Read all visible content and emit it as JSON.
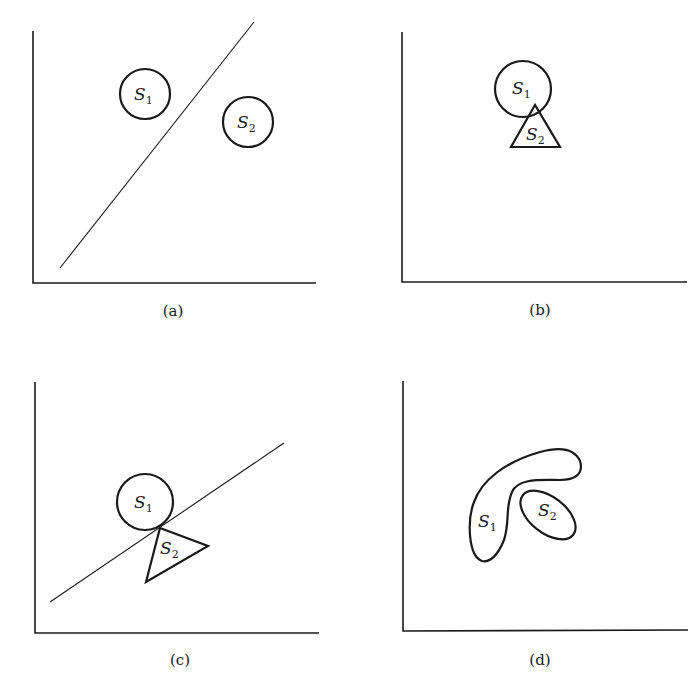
{
  "figure": {
    "panels": [
      {
        "id": "a",
        "caption": "(a)",
        "description": "Two disjoint circular sets separated by a straight line",
        "sets": [
          {
            "name": "S",
            "subscript": "1",
            "shape": "circle"
          },
          {
            "name": "S",
            "subscript": "2",
            "shape": "circle"
          }
        ],
        "separator": "line"
      },
      {
        "id": "b",
        "caption": "(b)",
        "description": "Circle S1 and triangle S2 overlapping",
        "sets": [
          {
            "name": "S",
            "subscript": "1",
            "shape": "circle"
          },
          {
            "name": "S",
            "subscript": "2",
            "shape": "triangle"
          }
        ],
        "separator": "none"
      },
      {
        "id": "c",
        "caption": "(c)",
        "description": "Circle S1 and triangle S2 touching at a point, separated by a supporting line",
        "sets": [
          {
            "name": "S",
            "subscript": "1",
            "shape": "circle"
          },
          {
            "name": "S",
            "subscript": "2",
            "shape": "triangle"
          }
        ],
        "separator": "line"
      },
      {
        "id": "d",
        "caption": "(d)",
        "description": "Nonconvex set S1 curving around convex ellipse S2, not linearly separable",
        "sets": [
          {
            "name": "S",
            "subscript": "1",
            "shape": "nonconvex blob"
          },
          {
            "name": "S",
            "subscript": "2",
            "shape": "ellipse"
          }
        ],
        "separator": "none"
      }
    ]
  }
}
